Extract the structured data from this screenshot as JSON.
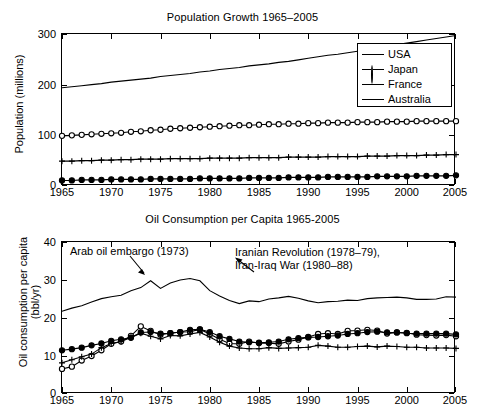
{
  "figure": {
    "background": "#ffffff",
    "foreground": "#000000"
  },
  "panels": [
    {
      "id": "population",
      "title": "Population Growth 1965–2005",
      "ylabel": "Population (millions)",
      "legend_position": "top-right"
    },
    {
      "id": "oil",
      "title": "Oil Consumption per Capita 1965-2005",
      "ylabel_line1": "Oil consumption per capita",
      "ylabel_line2": "(bbl/yr)",
      "annotations": [
        {
          "name": "arab-oil-embargo",
          "text": "Arab oil embargo (1973)"
        },
        {
          "name": "iranian-revolution",
          "line1": "Iranian Revolution (1978–79),",
          "line2": "Iran-Iraq War (1980–88)"
        }
      ]
    }
  ],
  "legend": {
    "items": [
      {
        "label": "USA",
        "marker": "none"
      },
      {
        "label": "Japan",
        "marker": "open-circle"
      },
      {
        "label": "France",
        "marker": "plus"
      },
      {
        "label": "Australia",
        "marker": "filled-circle"
      }
    ]
  },
  "chart_data": [
    {
      "type": "line",
      "title": "Population Growth 1965–2005",
      "xlabel": "",
      "ylabel": "Population (millions)",
      "xlim": [
        1965,
        2005
      ],
      "ylim": [
        0,
        300
      ],
      "xticks": [
        1965,
        1970,
        1975,
        1980,
        1985,
        1990,
        1995,
        2000,
        2005
      ],
      "yticks": [
        0,
        100,
        200,
        300
      ],
      "grid": false,
      "legend": [
        "USA",
        "Japan",
        "France",
        "Australia"
      ],
      "legend_position": "upper right",
      "x": [
        1965,
        1966,
        1967,
        1968,
        1969,
        1970,
        1971,
        1972,
        1973,
        1974,
        1975,
        1976,
        1977,
        1978,
        1979,
        1980,
        1981,
        1982,
        1983,
        1984,
        1985,
        1986,
        1987,
        1988,
        1989,
        1990,
        1991,
        1992,
        1993,
        1994,
        1995,
        1996,
        1997,
        1998,
        1999,
        2000,
        2001,
        2002,
        2003,
        2004,
        2005
      ],
      "series": [
        {
          "name": "USA",
          "marker": "none",
          "values": [
            194,
            196,
            198,
            200,
            202,
            205,
            207,
            209,
            211,
            213,
            216,
            218,
            220,
            222,
            225,
            227,
            230,
            232,
            234,
            237,
            239,
            241,
            244,
            246,
            249,
            252,
            255,
            258,
            260,
            263,
            266,
            269,
            272,
            276,
            279,
            282,
            285,
            288,
            291,
            294,
            297
          ]
        },
        {
          "name": "Japan",
          "marker": "open-circle",
          "values": [
            99,
            100,
            101,
            102,
            103,
            104,
            105,
            107,
            108,
            110,
            111,
            113,
            114,
            115,
            116,
            117,
            118,
            119,
            120,
            120,
            121,
            122,
            122,
            123,
            123,
            124,
            124,
            125,
            125,
            125,
            126,
            126,
            126,
            127,
            127,
            127,
            128,
            128,
            128,
            128,
            128
          ]
        },
        {
          "name": "France",
          "marker": "plus",
          "values": [
            49,
            49,
            50,
            50,
            51,
            51,
            52,
            52,
            53,
            53,
            53,
            54,
            54,
            54,
            54,
            55,
            55,
            55,
            55,
            56,
            56,
            56,
            56,
            57,
            57,
            57,
            57,
            58,
            58,
            58,
            58,
            59,
            59,
            59,
            60,
            60,
            60,
            61,
            61,
            62,
            62
          ]
        },
        {
          "name": "Australia",
          "marker": "filled-circle",
          "values": [
            11,
            11,
            12,
            12,
            12,
            13,
            13,
            13,
            13,
            14,
            14,
            14,
            14,
            14,
            15,
            15,
            15,
            15,
            15,
            16,
            16,
            16,
            16,
            17,
            17,
            17,
            17,
            18,
            18,
            18,
            18,
            18,
            19,
            19,
            19,
            19,
            20,
            20,
            20,
            20,
            21
          ]
        }
      ]
    },
    {
      "type": "line",
      "title": "Oil Consumption per Capita 1965-2005",
      "xlabel": "",
      "ylabel": "Oil consumption per capita (bbl/yr)",
      "xlim": [
        1965,
        2005
      ],
      "ylim": [
        0,
        40
      ],
      "xticks": [
        1965,
        1970,
        1975,
        1980,
        1985,
        1990,
        1995,
        2000,
        2005
      ],
      "yticks": [
        0,
        10,
        20,
        30,
        40
      ],
      "grid": false,
      "annotations": [
        {
          "text": "Arab oil embargo (1973)",
          "points_to_year": 1973
        },
        {
          "text": "Iranian Revolution (1978–79), Iran-Iraq War (1980–88)",
          "points_to_year": 1980
        }
      ],
      "x": [
        1965,
        1966,
        1967,
        1968,
        1969,
        1970,
        1971,
        1972,
        1973,
        1974,
        1975,
        1976,
        1977,
        1978,
        1979,
        1980,
        1981,
        1982,
        1983,
        1984,
        1985,
        1986,
        1987,
        1988,
        1989,
        1990,
        1991,
        1992,
        1993,
        1994,
        1995,
        1996,
        1997,
        1998,
        1999,
        2000,
        2001,
        2002,
        2003,
        2004,
        2005
      ],
      "series": [
        {
          "name": "USA",
          "marker": "none",
          "values": [
            21.8,
            22.6,
            23.2,
            24.2,
            25.1,
            25.6,
            26.0,
            27.2,
            28.0,
            29.8,
            27.8,
            29.2,
            30.0,
            30.4,
            29.8,
            27.2,
            25.8,
            24.6,
            23.8,
            24.5,
            24.3,
            25.0,
            25.3,
            25.7,
            25.2,
            24.5,
            24.0,
            24.3,
            24.4,
            24.7,
            24.6,
            25.1,
            25.3,
            25.4,
            25.5,
            25.3,
            24.9,
            24.9,
            25.0,
            25.6,
            25.5
          ]
        },
        {
          "name": "Japan",
          "marker": "open-circle",
          "values": [
            6.6,
            7.2,
            8.8,
            10.0,
            11.5,
            13.2,
            13.8,
            15.3,
            17.8,
            16.6,
            15.6,
            16.0,
            16.3,
            16.4,
            17.0,
            15.8,
            14.4,
            13.3,
            13.2,
            13.8,
            13.4,
            13.4,
            13.2,
            13.8,
            14.3,
            15.0,
            15.8,
            16.0,
            15.8,
            16.6,
            16.7,
            16.9,
            16.7,
            15.9,
            16.2,
            16.1,
            15.6,
            15.5,
            15.4,
            15.5,
            15.2
          ]
        },
        {
          "name": "France",
          "marker": "plus",
          "values": [
            8.2,
            9.0,
            9.8,
            10.5,
            12.2,
            13.3,
            13.8,
            14.9,
            16.0,
            15.2,
            14.5,
            15.4,
            15.3,
            15.8,
            16.2,
            15.0,
            13.6,
            12.6,
            12.1,
            11.9,
            11.9,
            12.2,
            12.0,
            12.1,
            12.2,
            12.3,
            12.8,
            12.6,
            12.3,
            12.3,
            12.5,
            12.6,
            12.4,
            12.6,
            12.5,
            12.3,
            12.3,
            12.1,
            12.1,
            12.1,
            12.0
          ]
        },
        {
          "name": "Australia",
          "marker": "filled-circle",
          "values": [
            11.5,
            11.8,
            12.2,
            12.8,
            13.3,
            14.0,
            14.4,
            14.8,
            16.2,
            16.3,
            15.9,
            16.0,
            16.3,
            16.9,
            17.0,
            16.3,
            15.2,
            14.5,
            13.8,
            13.6,
            13.5,
            13.6,
            13.8,
            14.4,
            14.7,
            14.9,
            15.0,
            15.2,
            15.4,
            15.8,
            16.0,
            16.3,
            16.4,
            16.2,
            16.2,
            16.0,
            15.9,
            15.9,
            15.9,
            15.9,
            15.7
          ]
        }
      ]
    }
  ]
}
